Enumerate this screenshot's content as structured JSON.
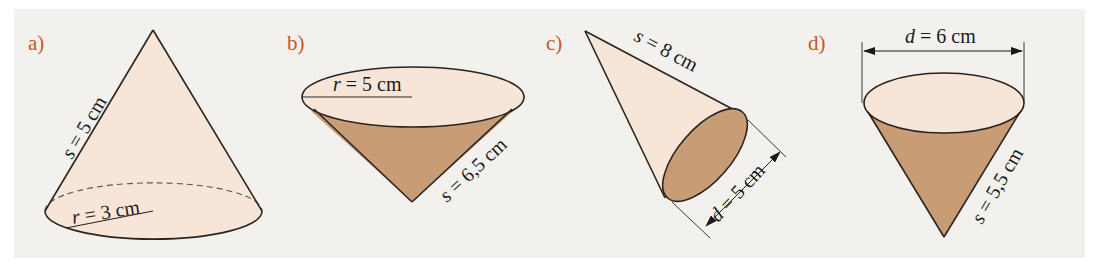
{
  "figure": {
    "colors": {
      "panel_background": "#f3f1ee",
      "cone_light": "#f7e6d8",
      "cone_dark": "#c89d76",
      "outline": "#2a2420",
      "label": "#c8552a"
    },
    "cones": [
      {
        "id": "a",
        "label": "a)",
        "orientation": "upright",
        "measurements": [
          {
            "variable": "s",
            "text": "s = 5 cm",
            "value": 5,
            "unit": "cm",
            "meaning": "slant height"
          },
          {
            "variable": "r",
            "text": "r = 3 cm",
            "value": 3,
            "unit": "cm",
            "meaning": "radius"
          }
        ]
      },
      {
        "id": "b",
        "label": "b)",
        "orientation": "inverted",
        "measurements": [
          {
            "variable": "r",
            "text": "r = 5 cm",
            "value": 5,
            "unit": "cm",
            "meaning": "radius"
          },
          {
            "variable": "s",
            "text": "s = 6,5 cm",
            "value": 6.5,
            "unit": "cm",
            "meaning": "slant height"
          }
        ]
      },
      {
        "id": "c",
        "label": "c)",
        "orientation": "tilted",
        "measurements": [
          {
            "variable": "s",
            "text": "s = 8 cm",
            "value": 8,
            "unit": "cm",
            "meaning": "slant height"
          },
          {
            "variable": "d",
            "text": "d = 5 cm",
            "value": 5,
            "unit": "cm",
            "meaning": "diameter"
          }
        ]
      },
      {
        "id": "d",
        "label": "d)",
        "orientation": "inverted",
        "measurements": [
          {
            "variable": "d",
            "text": "d = 6 cm",
            "value": 6,
            "unit": "cm",
            "meaning": "diameter"
          },
          {
            "variable": "s",
            "text": "s = 5,5 cm",
            "value": 5.5,
            "unit": "cm",
            "meaning": "slant height"
          }
        ]
      }
    ]
  },
  "text": {
    "a_label": "a)",
    "b_label": "b)",
    "c_label": "c)",
    "d_label": "d)",
    "a_s": "s = 5 cm",
    "a_r": "r = 3 cm",
    "b_r": "r = 5 cm",
    "b_s": "s = 6,5 cm",
    "c_s": "s = 8 cm",
    "c_d": "d = 5 cm",
    "d_d": "d = 6 cm",
    "d_s": "s = 5,5 cm"
  }
}
